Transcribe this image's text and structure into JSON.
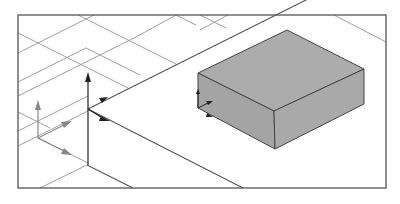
{
  "figure": {
    "colors": {
      "background": "#ffffff",
      "frame": "#555555",
      "grid": "#9a9a9a",
      "plane_edge": "#444444",
      "box_fill": "#a9a9a9",
      "box_edge": "#444444",
      "axis_dark": "#222222",
      "axis_grey": "#888888"
    },
    "elements": {
      "grid_label": "ground-grid",
      "box_label": "solid-box",
      "dark_frame_label": "coordinate-frame-dark",
      "grey_frame_label": "coordinate-frame-grey",
      "box_frame_label": "coordinate-frame-box"
    }
  }
}
